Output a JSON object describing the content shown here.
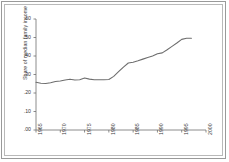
{
  "chart_data": {
    "type": "line",
    "title": "",
    "subtitle": "",
    "xlabel": "",
    "ylabel": "Share of median family income",
    "xlim": [
      1965,
      2000
    ],
    "ylim": [
      0.0,
      0.6
    ],
    "grid": false,
    "legend": null,
    "xticks": [
      "1965",
      "1970",
      "1975",
      "1980",
      "1985",
      "1990",
      "1995",
      "2000"
    ],
    "xtick_values": [
      1965,
      1970,
      1975,
      1980,
      1985,
      1990,
      1995,
      2000
    ],
    "yticks": [
      ".00",
      ".10",
      ".20",
      ".30",
      ".40",
      ".50",
      ".60"
    ],
    "ytick_values": [
      0.0,
      0.1,
      0.2,
      0.3,
      0.4,
      0.5,
      0.6
    ],
    "line_color": "#6e6e6e",
    "series": [
      {
        "name": "Share of median family income",
        "x": [
          1965,
          1966,
          1967,
          1968,
          1969,
          1970,
          1971,
          1972,
          1973,
          1974,
          1975,
          1976,
          1977,
          1978,
          1979,
          1980,
          1981,
          1982,
          1983,
          1984,
          1985,
          1986,
          1987,
          1988,
          1989,
          1990,
          1991,
          1992,
          1993,
          1994,
          1995,
          1996,
          1997
        ],
        "values": [
          0.258,
          0.253,
          0.251,
          0.255,
          0.262,
          0.265,
          0.27,
          0.274,
          0.27,
          0.272,
          0.281,
          0.275,
          0.272,
          0.272,
          0.272,
          0.273,
          0.29,
          0.315,
          0.34,
          0.362,
          0.366,
          0.374,
          0.383,
          0.392,
          0.4,
          0.412,
          0.417,
          0.434,
          0.452,
          0.47,
          0.49,
          0.496,
          0.496
        ]
      }
    ]
  },
  "axis": {
    "tick_color": "#6e6e6e",
    "axis_color": "#6e6e6e"
  }
}
